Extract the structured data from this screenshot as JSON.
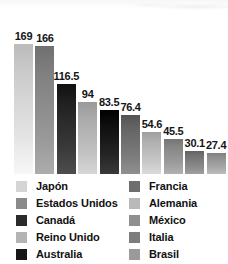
{
  "chart_data": {
    "type": "bar",
    "title": "",
    "subtitle": "",
    "xlabel": "",
    "ylabel": "",
    "grid": false,
    "legend_position": "bottom",
    "ylim": [
      0,
      169
    ],
    "categories": [
      "Japón",
      "Estados Unidos",
      "Canadá",
      "Reino Unido",
      "Australia",
      "Francia",
      "Alemania",
      "México",
      "Italia",
      "Brasil"
    ],
    "values": [
      169,
      166,
      116.5,
      94,
      83.5,
      76.4,
      54.6,
      45.5,
      30.1,
      27.4
    ],
    "value_labels": [
      "169",
      "166",
      "116.5",
      "94",
      "83.5",
      "76.4",
      "54.6",
      "45.5",
      "30.1",
      "27.4"
    ],
    "colors": [
      "#d5d5d5",
      "#8a8a8a",
      "#2b2b2b",
      "#b4b4b4",
      "#171717",
      "#6e6e6e",
      "#b9b9b9",
      "#8f8f8f",
      "#7d7d7d",
      "#9a9a9a"
    ],
    "series": [
      {
        "name": "",
        "values": [
          169,
          166,
          116.5,
          94,
          83.5,
          76.4,
          54.6,
          45.5,
          30.1,
          27.4
        ]
      }
    ]
  },
  "legend": {
    "columns": [
      {
        "items": [
          {
            "label": "Japón",
            "color": "#d5d5d5"
          },
          {
            "label": "Estados Unidos",
            "color": "#8a8a8a"
          },
          {
            "label": "Canadá",
            "color": "#2b2b2b"
          },
          {
            "label": "Reino Unido",
            "color": "#b4b4b4"
          },
          {
            "label": "Australia",
            "color": "#171717"
          }
        ]
      },
      {
        "items": [
          {
            "label": "Francia",
            "color": "#6e6e6e"
          },
          {
            "label": "Alemania",
            "color": "#b9b9b9"
          },
          {
            "label": "México",
            "color": "#8f8f8f"
          },
          {
            "label": "Italia",
            "color": "#7d7d7d"
          },
          {
            "label": "Brasil",
            "color": "#9a9a9a"
          }
        ]
      }
    ]
  }
}
